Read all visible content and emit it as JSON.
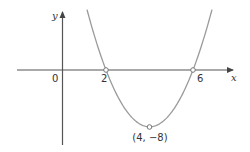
{
  "chart_data": {
    "type": "line",
    "title": "",
    "function": "y = (x - 2)(x - 6) = x^2 - 8x + 12",
    "xlabel": "x",
    "ylabel": "y",
    "origin_label": "0",
    "x_intercepts": [
      {
        "x": 2,
        "y": 0,
        "label": "2"
      },
      {
        "x": 6,
        "y": 0,
        "label": "6"
      }
    ],
    "vertex": {
      "x": 4,
      "y": -8,
      "label": "(4, −8)"
    },
    "curve_shape": "upward parabola",
    "grid": false,
    "legend": null
  },
  "labels": {
    "y_axis": "y",
    "x_axis": "x",
    "origin": "0",
    "root_left": "2",
    "root_right": "6",
    "vertex": "(4, −8)"
  },
  "colors": {
    "axis": "#555555",
    "curve": "#9a9a9a",
    "marker": "#777777",
    "text": "#333333"
  }
}
